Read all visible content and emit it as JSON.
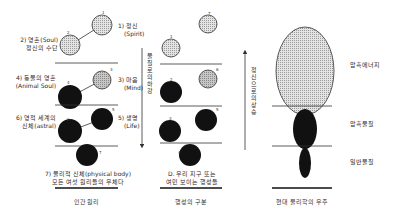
{
  "columns": {
    "human": {
      "title": "인간 원리",
      "labels": {
        "spirit": [
          "1) 정신",
          "(Spirit)"
        ],
        "soul": [
          "2) 영혼(Soul)",
          "정신의 수단"
        ],
        "mind": [
          "3) 마음",
          "(Mind)"
        ],
        "animal_soul": [
          "4) 동물의 영혼",
          "(Animal Soul)"
        ],
        "life": [
          "5) 생명",
          "(Life)"
        ],
        "astral": [
          "6) 영적 세계의",
          "신체(astral)"
        ],
        "physical": [
          "7) 물리적 신체(physical body)",
          "모든 여섯 원리들의 우체다"
        ]
      },
      "numbers": [
        "1",
        "2",
        "3",
        "4",
        "5",
        "6",
        "7"
      ]
    },
    "planet": {
      "title": "행성의 구분",
      "arrow_label": "물질로의 하강",
      "caption": [
        "D. 우리 지구 또는",
        "여민 보이는 행성들"
      ],
      "numbers": [
        "1",
        "7",
        "2",
        "6",
        "3",
        "5",
        "4"
      ]
    },
    "universe": {
      "title": "현대 물리학의 우주",
      "arrow_label": "정신으로의 상승",
      "labels": {
        "dark_energy": "암흑에너지",
        "dark_matter": "암흑물질",
        "ordinary_matter": "일반물질"
      }
    }
  },
  "colors": {
    "ink": "#111111",
    "light_fill": "#d8d8d8",
    "mid_fill": "#b9b9b9",
    "line": "#333333"
  }
}
